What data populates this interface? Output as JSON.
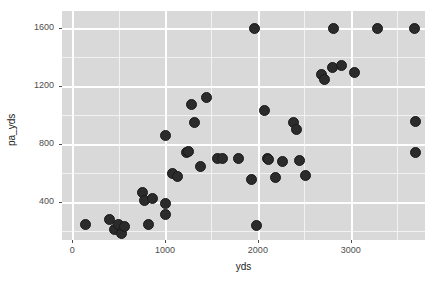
{
  "chart_data": {
    "type": "scatter",
    "title": "",
    "xlabel": "yds",
    "ylabel": "pa_yds",
    "xlim": [
      -110,
      3800
    ],
    "ylim": [
      140,
      1720
    ],
    "xticks": [
      0,
      1000,
      2000,
      3000
    ],
    "xtick_labels": [
      "0",
      "1000",
      "2000",
      "3000"
    ],
    "yticks": [
      400,
      800,
      1200,
      1600
    ],
    "ytick_labels": [
      "400",
      "800",
      "1200",
      "1600"
    ],
    "grid": true,
    "legend": "none",
    "point_color": "#2b2b2b",
    "panel_color": "#d9d9d9",
    "gridline_color": "#ffffff",
    "points": [
      {
        "x": 140,
        "y": 245
      },
      {
        "x": 400,
        "y": 280
      },
      {
        "x": 455,
        "y": 215
      },
      {
        "x": 500,
        "y": 250
      },
      {
        "x": 530,
        "y": 185
      },
      {
        "x": 560,
        "y": 230
      },
      {
        "x": 760,
        "y": 470
      },
      {
        "x": 775,
        "y": 415
      },
      {
        "x": 820,
        "y": 250
      },
      {
        "x": 870,
        "y": 425
      },
      {
        "x": 1000,
        "y": 315
      },
      {
        "x": 1000,
        "y": 395
      },
      {
        "x": 1010,
        "y": 860
      },
      {
        "x": 1080,
        "y": 600
      },
      {
        "x": 1130,
        "y": 575
      },
      {
        "x": 1230,
        "y": 745
      },
      {
        "x": 1255,
        "y": 750
      },
      {
        "x": 1290,
        "y": 1075
      },
      {
        "x": 1320,
        "y": 950
      },
      {
        "x": 1380,
        "y": 650
      },
      {
        "x": 1450,
        "y": 1120
      },
      {
        "x": 1560,
        "y": 700
      },
      {
        "x": 1620,
        "y": 700
      },
      {
        "x": 1790,
        "y": 700
      },
      {
        "x": 1930,
        "y": 560
      },
      {
        "x": 1960,
        "y": 1600
      },
      {
        "x": 1980,
        "y": 240
      },
      {
        "x": 2070,
        "y": 1035
      },
      {
        "x": 2100,
        "y": 700
      },
      {
        "x": 2110,
        "y": 695
      },
      {
        "x": 2190,
        "y": 570
      },
      {
        "x": 2270,
        "y": 680
      },
      {
        "x": 2380,
        "y": 950
      },
      {
        "x": 2420,
        "y": 905
      },
      {
        "x": 2450,
        "y": 690
      },
      {
        "x": 2510,
        "y": 585
      },
      {
        "x": 2680,
        "y": 1285
      },
      {
        "x": 2720,
        "y": 1250
      },
      {
        "x": 2800,
        "y": 1330
      },
      {
        "x": 2810,
        "y": 1600
      },
      {
        "x": 2900,
        "y": 1345
      },
      {
        "x": 3040,
        "y": 1295
      },
      {
        "x": 3290,
        "y": 1600
      },
      {
        "x": 3690,
        "y": 1600
      },
      {
        "x": 3700,
        "y": 960
      },
      {
        "x": 3700,
        "y": 745
      }
    ]
  }
}
